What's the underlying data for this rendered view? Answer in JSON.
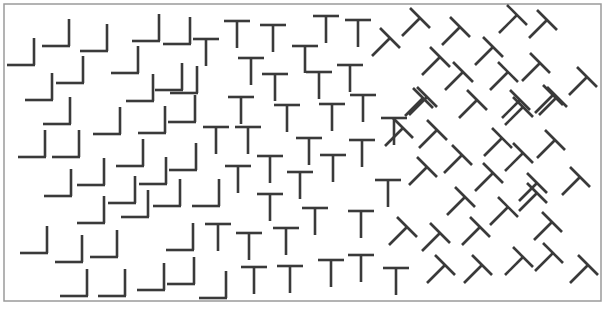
{
  "canvas": {
    "width": 607,
    "height": 309,
    "background": "#ffffff"
  },
  "frame": {
    "x": 4,
    "y": 4,
    "width": 597,
    "height": 297,
    "stroke": "#9a9a9a"
  },
  "ink_color": "#3a3a3a",
  "geometry": {
    "L": {
      "arm": 27
    },
    "T": {
      "half_bar": 13,
      "stem": 27
    },
    "R": {
      "half_bar_dx": 10,
      "half_bar_dy": 10,
      "stem_dx": -18,
      "stem_dy": 18
    }
  },
  "regions": [
    {
      "name": "left-region",
      "shape": "L",
      "description": "L-shaped elements (vertical arm up at right end)"
    },
    {
      "name": "middle-region",
      "shape": "T",
      "description": "upright T elements"
    },
    {
      "name": "right-region",
      "shape": "R",
      "description": "T elements rotated 45 degrees"
    }
  ],
  "elements": {
    "L": [
      [
        34,
        65
      ],
      [
        69,
        46
      ],
      [
        107,
        51
      ],
      [
        159,
        41
      ],
      [
        190,
        44
      ],
      [
        83,
        83
      ],
      [
        138,
        73
      ],
      [
        182,
        90
      ],
      [
        197,
        93
      ],
      [
        70,
        124
      ],
      [
        120,
        134
      ],
      [
        165,
        133
      ],
      [
        195,
        122
      ],
      [
        45,
        157
      ],
      [
        79,
        157
      ],
      [
        143,
        166
      ],
      [
        196,
        170
      ],
      [
        104,
        185
      ],
      [
        166,
        184
      ],
      [
        71,
        196
      ],
      [
        135,
        203
      ],
      [
        180,
        206
      ],
      [
        219,
        206
      ],
      [
        104,
        223
      ],
      [
        148,
        217
      ],
      [
        47,
        253
      ],
      [
        82,
        262
      ],
      [
        117,
        257
      ],
      [
        193,
        250
      ],
      [
        87,
        296
      ],
      [
        125,
        296
      ],
      [
        164,
        290
      ],
      [
        194,
        284
      ],
      [
        226,
        298
      ],
      [
        52,
        100
      ],
      [
        153,
        101
      ]
    ],
    "T": [
      [
        206,
        39
      ],
      [
        237,
        21
      ],
      [
        273,
        25
      ],
      [
        326,
        16
      ],
      [
        358,
        20
      ],
      [
        305,
        46
      ],
      [
        251,
        58
      ],
      [
        275,
        74
      ],
      [
        319,
        72
      ],
      [
        350,
        65
      ],
      [
        241,
        97
      ],
      [
        287,
        105
      ],
      [
        332,
        104
      ],
      [
        363,
        95
      ],
      [
        216,
        127
      ],
      [
        248,
        127
      ],
      [
        309,
        138
      ],
      [
        362,
        140
      ],
      [
        270,
        156
      ],
      [
        238,
        166
      ],
      [
        333,
        155
      ],
      [
        300,
        172
      ],
      [
        270,
        194
      ],
      [
        315,
        208
      ],
      [
        361,
        211
      ],
      [
        218,
        224
      ],
      [
        249,
        233
      ],
      [
        286,
        228
      ],
      [
        254,
        267
      ],
      [
        290,
        266
      ],
      [
        331,
        260
      ],
      [
        361,
        255
      ],
      [
        396,
        268
      ],
      [
        388,
        180
      ],
      [
        394,
        118
      ]
    ],
    "R": [
      [
        390,
        38
      ],
      [
        420,
        18
      ],
      [
        460,
        27
      ],
      [
        517,
        15
      ],
      [
        547,
        20
      ],
      [
        440,
        57
      ],
      [
        493,
        47
      ],
      [
        463,
        72
      ],
      [
        508,
        72
      ],
      [
        540,
        63
      ],
      [
        587,
        77
      ],
      [
        427,
        97
      ],
      [
        477,
        100
      ],
      [
        520,
        100
      ],
      [
        553,
        95
      ],
      [
        423,
        98
      ],
      [
        523,
        107
      ],
      [
        557,
        97
      ],
      [
        403,
        128
      ],
      [
        437,
        130
      ],
      [
        502,
        138
      ],
      [
        555,
        140
      ],
      [
        462,
        155
      ],
      [
        523,
        153
      ],
      [
        427,
        167
      ],
      [
        493,
        173
      ],
      [
        537,
        183
      ],
      [
        580,
        177
      ],
      [
        465,
        197
      ],
      [
        508,
        207
      ],
      [
        537,
        193
      ],
      [
        407,
        227
      ],
      [
        440,
        233
      ],
      [
        480,
        227
      ],
      [
        552,
        222
      ],
      [
        445,
        265
      ],
      [
        482,
        265
      ],
      [
        523,
        257
      ],
      [
        553,
        253
      ],
      [
        588,
        265
      ]
    ]
  }
}
